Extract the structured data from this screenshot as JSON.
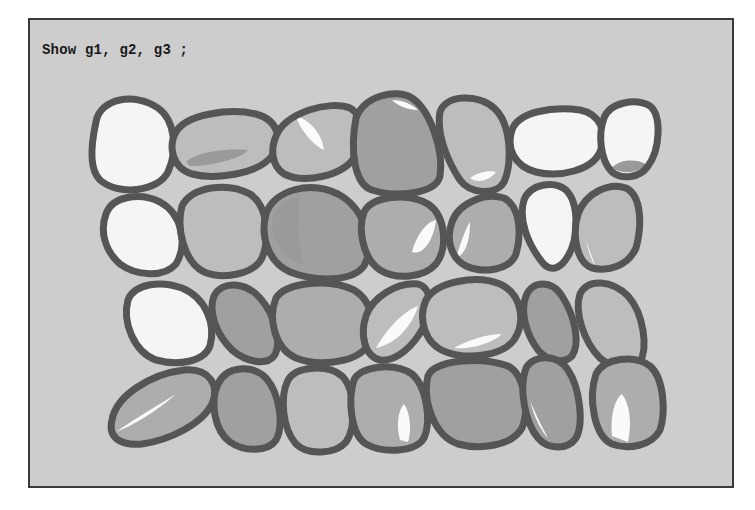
{
  "caption": "Show g1, g2, g3 ;",
  "colors": {
    "background": "#cdcdcd",
    "frame_border": "#3a3a3a",
    "outline": "#555555",
    "white": "#f5f5f5",
    "light": "#bdbdbd",
    "mid": "#adadad",
    "dark": "#a0a0a0",
    "shadow": "#9a9a9a",
    "highlight": "#fafafa"
  },
  "pebbles": [
    {
      "row": 1,
      "tone": "white",
      "d": "M96,122 C100,98 135,92 158,108 C175,120 178,150 168,172 C158,192 118,196 100,180 C88,168 92,140 96,122 Z"
    },
    {
      "row": 1,
      "tone": "light",
      "d": "M176,132 C186,114 230,108 256,114 C278,120 284,140 272,156 C258,174 216,180 192,174 C172,168 168,146 176,132 Z",
      "shade": "M186,162 C196,152 226,148 248,150 C242,158 214,166 190,166 Z"
    },
    {
      "row": 1,
      "tone": "light",
      "d": "M276,136 C286,112 330,100 350,108 C364,116 364,138 354,158 C342,176 304,184 284,174 C272,166 270,150 276,136 Z",
      "hl": "M296,116 C310,120 322,134 324,150 C314,146 300,130 296,116 Z"
    },
    {
      "row": 1,
      "tone": "dark",
      "d": "M356,118 C364,96 396,88 412,98 C430,110 444,150 440,176 C436,194 396,198 372,190 C354,184 350,150 356,118 Z",
      "hl": "M392,100 C402,100 412,104 418,110 C408,110 398,106 392,100 Z"
    },
    {
      "row": 1,
      "tone": "light",
      "d": "M440,112 C446,94 478,94 494,108 C512,124 512,164 504,182 C496,196 470,194 460,180 C448,162 436,134 440,112 Z",
      "hl": "M470,178 C478,172 490,170 496,172 C490,180 478,184 470,178 Z"
    },
    {
      "row": 1,
      "tone": "white",
      "d": "M512,130 C518,112 552,106 580,110 C600,114 608,132 600,152 C592,170 560,178 536,172 C514,166 506,148 512,130 Z"
    },
    {
      "row": 1,
      "tone": "white",
      "d": "M604,118 C610,102 636,98 650,106 C662,116 660,150 648,166 C640,178 622,180 612,172 C600,160 598,134 604,118 Z",
      "shade": "M612,168 C618,160 634,158 646,164 C640,172 624,176 612,168 Z"
    },
    {
      "row": 2,
      "tone": "white",
      "d": "M106,214 C112,196 140,192 160,202 C182,214 188,244 176,264 C164,278 136,276 120,264 C104,250 100,230 106,214 Z"
    },
    {
      "row": 2,
      "tone": "light",
      "d": "M182,206 C192,186 228,182 250,194 C268,206 270,238 262,258 C254,274 224,280 204,272 C184,262 176,228 182,206 Z"
    },
    {
      "row": 2,
      "tone": "dark",
      "d": "M266,214 C274,190 310,180 338,194 C364,208 376,244 364,266 C352,282 316,282 290,272 C268,262 260,236 266,214 Z",
      "shade": "M272,222 C276,204 290,196 300,198 C296,220 298,248 304,264 C288,262 272,244 272,222 Z"
    },
    {
      "row": 2,
      "tone": "mid",
      "d": "M364,212 C372,196 408,192 428,204 C446,216 448,248 436,264 C424,278 396,280 380,270 C362,258 358,228 364,212 Z",
      "hl": "M412,252 C416,236 426,222 436,220 C434,238 424,256 412,252 Z"
    },
    {
      "row": 2,
      "tone": "mid",
      "d": "M452,222 C458,204 484,192 504,198 C520,206 522,234 516,254 C510,270 484,274 466,266 C450,258 446,238 452,222 Z",
      "hl": "M456,258 C460,244 466,228 470,222 C470,240 466,254 456,258 Z"
    },
    {
      "row": 2,
      "tone": "white",
      "d": "M524,200 C530,184 554,180 566,190 C580,204 578,240 568,256 C560,270 550,272 542,262 C528,244 518,220 524,200 Z"
    },
    {
      "row": 2,
      "tone": "light",
      "d": "M578,214 C586,192 610,182 626,188 C642,196 642,226 636,248 C628,266 608,272 592,268 C576,262 572,234 578,214 Z",
      "hl": "M586,240 C590,252 594,262 596,268 C592,262 588,250 586,240 Z"
    },
    {
      "row": 3,
      "tone": "white",
      "d": "M128,300 C134,284 160,280 182,288 C206,298 216,324 210,346 C204,362 178,366 156,360 C134,352 122,322 128,300 Z"
    },
    {
      "row": 3,
      "tone": "dark",
      "d": "M214,296 C222,280 246,282 260,298 C276,316 282,344 274,356 C266,366 246,362 232,350 C216,334 208,312 214,296 Z"
    },
    {
      "row": 3,
      "tone": "mid",
      "d": "M276,298 C286,282 330,278 354,290 C374,302 378,332 366,348 C352,364 316,366 296,358 C274,348 268,318 276,298 Z"
    },
    {
      "row": 3,
      "tone": "light",
      "d": "M366,316 C372,298 396,282 418,284 C432,288 432,308 424,326 C414,346 396,362 380,360 C364,356 360,334 366,316 Z",
      "hl": "M376,348 C386,330 402,312 418,306 C412,326 396,344 376,348 Z"
    },
    {
      "row": 3,
      "tone": "light",
      "d": "M426,300 C436,282 476,274 500,284 C522,294 526,322 514,340 C502,356 468,360 446,352 C424,344 418,318 426,300 Z",
      "hl": "M454,348 C468,340 488,334 502,334 C494,342 472,350 454,348 Z"
    },
    {
      "row": 3,
      "tone": "dark",
      "d": "M526,296 C532,280 552,280 562,296 C576,318 580,344 572,356 C564,364 548,362 538,350 C526,334 520,312 526,296 Z",
      "hl": "M572,342 C574,346 576,350 576,354 C574,350 572,346 572,342 Z"
    },
    {
      "row": 3,
      "tone": "light",
      "d": "M580,294 C588,278 612,280 628,296 C644,314 648,348 640,362 C632,372 614,370 600,358 C584,342 574,312 580,294 Z"
    },
    {
      "row": 4,
      "tone": "mid",
      "d": "M112,420 C116,396 150,374 184,370 C210,368 220,386 212,404 C202,424 170,440 142,444 C118,446 108,436 112,420 Z",
      "hl": "M116,432 C136,418 160,404 176,394 C158,410 136,424 116,432 Z"
    },
    {
      "row": 4,
      "tone": "dark",
      "d": "M218,384 C226,366 252,364 266,378 C280,394 284,426 276,440 C268,452 244,452 230,442 C214,430 210,402 218,384 Z"
    },
    {
      "row": 4,
      "tone": "light",
      "d": "M288,380 C296,366 328,364 342,376 C356,390 356,428 346,442 C336,454 308,456 296,444 C282,428 280,396 288,380 Z"
    },
    {
      "row": 4,
      "tone": "mid",
      "d": "M354,380 C360,366 394,362 412,374 C426,386 432,420 424,438 C416,452 384,454 366,444 C350,434 348,398 354,380 Z",
      "hl": "M400,440 C396,426 398,410 404,404 C410,412 412,430 408,442 Z"
    },
    {
      "row": 4,
      "tone": "dark",
      "d": "M428,376 C434,360 480,356 508,366 C524,374 530,408 522,428 C512,446 480,450 458,444 C434,436 422,400 428,376 Z"
    },
    {
      "row": 4,
      "tone": "dark",
      "d": "M526,368 C534,354 558,354 568,370 C580,388 584,424 576,438 C568,450 548,450 538,438 C526,424 518,390 526,368 Z",
      "hl": "M530,400 C536,416 544,430 548,438 C542,432 534,418 530,400 Z"
    },
    {
      "row": 4,
      "tone": "mid",
      "d": "M596,374 C604,358 634,354 650,366 C664,378 666,412 660,430 C652,446 628,450 612,444 C594,436 588,398 596,374 Z",
      "hl": "M612,436 C610,418 614,400 622,394 C630,404 632,424 628,442 Z"
    }
  ]
}
